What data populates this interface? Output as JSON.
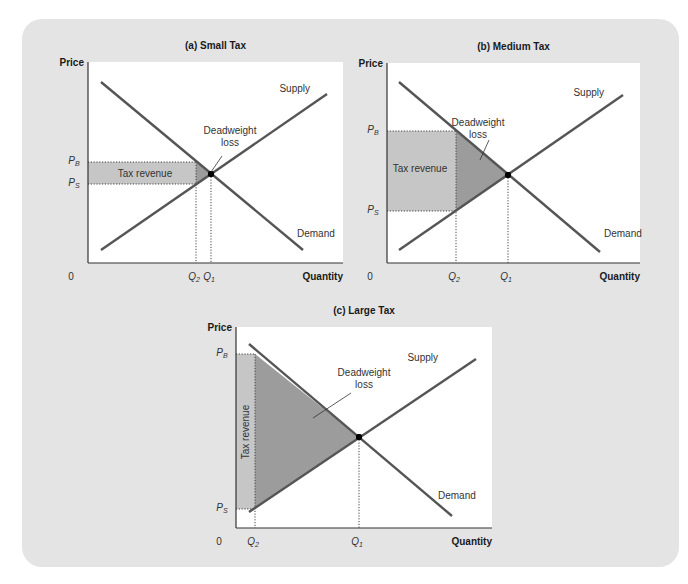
{
  "colors": {
    "background_panel": "#e4e4e4",
    "plot_bg": "#ffffff",
    "curve": "#555555",
    "tax_revenue_fill": "#c6c6c6",
    "deadweight_loss_fill": "#9c9c9c",
    "equilibrium_dot": "#000000"
  },
  "chart_data": [
    {
      "type": "line",
      "title": "(a) Small Tax",
      "xlabel": "Quantity",
      "ylabel": "Price",
      "origin_label": "0",
      "series": [
        {
          "name": "Supply",
          "slope": "upward"
        },
        {
          "name": "Demand",
          "slope": "downward"
        }
      ],
      "x_ticks": [
        "Q2",
        "Q1"
      ],
      "y_ticks": [
        "PB",
        "PS"
      ],
      "annotations": [
        "Tax revenue",
        "Deadweight loss"
      ],
      "geometry": {
        "plot": [
          88,
          62,
          343,
          263
        ],
        "demand": [
          [
            101,
            82
          ],
          [
            303,
            250
          ]
        ],
        "supply": [
          [
            101,
            250
          ],
          [
            327,
            94
          ]
        ],
        "eq": [
          211,
          174
        ],
        "pb": 162,
        "ps": 184,
        "q2": 196,
        "q1": 211
      },
      "label_pos": {
        "supply": [
          310,
          92
        ],
        "demand": [
          297,
          237
        ],
        "dwl": [
          230,
          134
        ],
        "dwl_line": [
          [
            222,
            156
          ],
          [
            211,
            172
          ]
        ],
        "tax_rev": [
          145,
          177
        ],
        "tax_rev_vertical": false
      }
    },
    {
      "type": "line",
      "title": "(b) Medium Tax",
      "xlabel": "Quantity",
      "ylabel": "Price",
      "origin_label": "0",
      "series": [
        {
          "name": "Supply",
          "slope": "upward"
        },
        {
          "name": "Demand",
          "slope": "downward"
        }
      ],
      "x_ticks": [
        "Q2",
        "Q1"
      ],
      "y_ticks": [
        "PB",
        "PS"
      ],
      "annotations": [
        "Tax revenue",
        "Deadweight loss"
      ],
      "geometry": {
        "plot": [
          387,
          63,
          640,
          263
        ],
        "demand": [
          [
            399,
            82
          ],
          [
            600,
            252
          ]
        ],
        "supply": [
          [
            399,
            250
          ],
          [
            623,
            95
          ]
        ],
        "eq": [
          508,
          175
        ],
        "pb": 131,
        "ps": 211,
        "q2": 456,
        "q1": 508
      },
      "label_pos": {
        "supply": [
          604,
          96
        ],
        "demand": [
          604,
          237
        ],
        "dwl": [
          478,
          126
        ],
        "dwl_line": [
          [
            489,
            140
          ],
          [
            480,
            160
          ]
        ],
        "tax_rev": [
          420,
          172
        ],
        "tax_rev_vertical": false
      }
    },
    {
      "type": "line",
      "title": "(c) Large Tax",
      "xlabel": "Quantity",
      "ylabel": "Price",
      "origin_label": "0",
      "series": [
        {
          "name": "Supply",
          "slope": "upward"
        },
        {
          "name": "Demand",
          "slope": "downward"
        }
      ],
      "x_ticks": [
        "Q2",
        "Q1"
      ],
      "y_ticks": [
        "PB",
        "PS"
      ],
      "annotations": [
        "Tax revenue",
        "Deadweight loss"
      ],
      "geometry": {
        "plot": [
          236,
          327,
          492,
          528
        ],
        "demand": [
          [
            249,
            344
          ],
          [
            452,
            516
          ]
        ],
        "supply": [
          [
            249,
            512
          ],
          [
            476,
            359
          ]
        ],
        "eq": [
          359,
          437
        ],
        "pb": 354,
        "ps": 509,
        "q2": 255,
        "q1": 359
      },
      "label_pos": {
        "supply": [
          438,
          361
        ],
        "demand": [
          438,
          499
        ],
        "dwl": [
          364,
          376
        ],
        "dwl_line": [
          [
            351,
            393
          ],
          [
            313,
            418
          ]
        ],
        "tax_rev": [
          249,
          432
        ],
        "tax_rev_vertical": true
      }
    }
  ]
}
